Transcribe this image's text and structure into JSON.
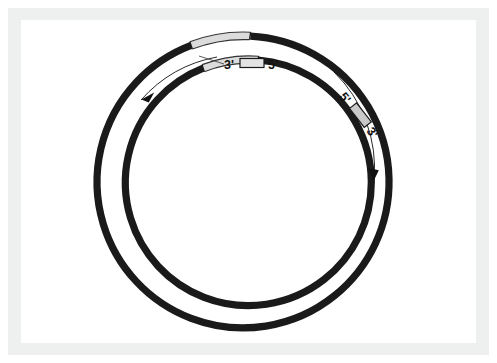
{
  "figure": {
    "background_color": "#ffffff",
    "frame_color": "#eef0f0",
    "panel_color": "#ffffff",
    "strand_dark_color": "#1a1a1a",
    "strand_light_color": "#d8d8d8",
    "strand_outline_color": "#2b2b2b",
    "arrow_color": "#111111",
    "label_box_fill": "#e3e3e3",
    "label_box_stroke": "#1a1a1a"
  },
  "geometry": {
    "center_x": 220,
    "center_y": 162,
    "outer_radius": 146,
    "inner_radius": 123,
    "strand_width": 7
  },
  "strands": [
    {
      "name": "outer-strand",
      "radius": 146,
      "dark_arc": {
        "start_deg": 279,
        "end_deg": 250
      },
      "light_arc": {
        "start_deg": 250,
        "end_deg": 279
      },
      "direction": "clockwise",
      "end_labels": {
        "three_prime": "3'",
        "five_prime": "5'"
      }
    },
    {
      "name": "inner-strand",
      "radius": 123,
      "dark_arc": {
        "start_deg": 288,
        "end_deg": 258
      },
      "light_arc": {
        "start_deg": 258,
        "end_deg": 288
      },
      "direction": "counterclockwise",
      "end_labels": {
        "three_prime": "3'",
        "five_prime": "5'"
      }
    }
  ],
  "labels": {
    "top": {
      "left_text": "3'",
      "right_text": "5'",
      "box_label": "strand-break-box",
      "rotation_deg": 0
    },
    "right": {
      "left_text": "5'",
      "right_text": "3'",
      "box_label": "strand-break-box",
      "rotation_deg": 52
    }
  },
  "arrows": [
    {
      "name": "inner-direction-arrow",
      "points_to": "counterclockwise",
      "position": "upper-left"
    },
    {
      "name": "outer-direction-arrow",
      "points_to": "clockwise",
      "position": "right"
    }
  ]
}
